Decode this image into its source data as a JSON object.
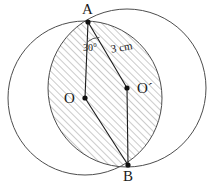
{
  "figure": {
    "stroke_color": "#4d4d4d",
    "chord_color": "#1a1a1a",
    "hatch_color": "#8c8c8c",
    "background": "#ffffff"
  },
  "labels": {
    "point_a": "A",
    "point_b": "B",
    "center_o": "O",
    "center_o_prime": "O´",
    "angle": "30°",
    "radius": "3 cm"
  },
  "geometry": {
    "point_a": {
      "x": 88,
      "y": 22
    },
    "point_b": {
      "x": 128,
      "y": 165
    },
    "center_o": {
      "x": 85,
      "y": 98
    },
    "center_o_prime": {
      "x": 127,
      "y": 88
    },
    "circle_left": {
      "cx": 85,
      "cy": 98,
      "r": 77
    },
    "circle_right": {
      "cx": 127,
      "cy": 88,
      "r": 79
    }
  }
}
